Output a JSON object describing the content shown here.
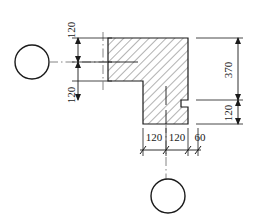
{
  "drawing": {
    "title": "Dimensioned L-shaped section detail",
    "type": "engineering-dimension-drawing",
    "units": "mm",
    "colors": {
      "outline": "#1a1a1a",
      "hatch": "#555555",
      "dimension": "#1a1a1a",
      "centerline": "#777777",
      "background": "#ffffff"
    },
    "dimensions": {
      "left_upper": "120",
      "left_lower": "120",
      "right_total": "370",
      "right_lower": "120",
      "bottom_first": "120",
      "bottom_second": "120",
      "bottom_third": "60"
    },
    "labels": {
      "left_upper_rotated": true,
      "left_lower_rotated": true,
      "right_total_rotated": true,
      "right_lower_rotated": true,
      "bottom_horizontal": true
    },
    "circles": {
      "left_marker": "",
      "bottom_marker": ""
    },
    "geometry": {
      "shape_name": "L-shaped hatched section",
      "hatch_angle_deg": 45,
      "hatch_spacing_px": 6
    }
  }
}
